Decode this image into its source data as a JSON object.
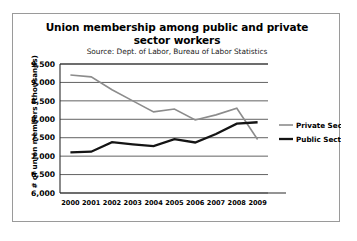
{
  "chart_data": {
    "type": "line",
    "title": "Union membership among public and private sector workers",
    "subtitle": "Source: Dept. of Labor, Bureau of Labor Statistics",
    "xlabel": "",
    "ylabel": "# of union members (thousands)",
    "categories": [
      "2000",
      "2001",
      "2002",
      "2003",
      "2004",
      "2005",
      "2006",
      "2007",
      "2008",
      "2009"
    ],
    "x": [
      2000,
      2001,
      2002,
      2003,
      2004,
      2005,
      2006,
      2007,
      2008,
      2009
    ],
    "ylim": [
      6000,
      9500
    ],
    "yticks": [
      6000,
      6500,
      7000,
      7500,
      8000,
      8500,
      9000,
      9500
    ],
    "ytick_labels": [
      "6,000",
      "6,500",
      "7,000",
      "7,500",
      "8,000",
      "8,500",
      "9,000",
      "9,500"
    ],
    "grid": true,
    "legend_position": "right",
    "series": [
      {
        "name": "Private Sector",
        "color": "#8c8c8c",
        "width": 1.6,
        "values": [
          9200,
          9150,
          8800,
          8500,
          8200,
          8280,
          7980,
          8120,
          8300,
          7450
        ]
      },
      {
        "name": "Public Sector",
        "color": "#141414",
        "width": 2.3,
        "values": [
          7100,
          7120,
          7380,
          7320,
          7270,
          7460,
          7370,
          7600,
          7880,
          7920
        ]
      }
    ]
  },
  "legend": {
    "items": [
      {
        "label": "Private Sector"
      },
      {
        "label": "Public Sector"
      }
    ]
  },
  "colors": {
    "private_sector": "#8c8c8c",
    "public_sector": "#141414",
    "frame_border": "#9a9a9a",
    "gridline": "#3a3a3a",
    "background": "#ffffff"
  }
}
